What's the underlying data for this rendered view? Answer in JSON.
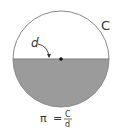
{
  "diagram": {
    "circle": {
      "cx": 61,
      "cy": 59,
      "r": 48,
      "stroke": "#8a8a8a",
      "lower_fill": "#9b9b9b",
      "upper_fill": "#ffffff"
    },
    "center_point": {
      "color": "#111111"
    },
    "labels": {
      "circumference": "C",
      "diameter": "d"
    },
    "formula": {
      "lhs": "π",
      "equals": "=",
      "numerator": "C",
      "denominator": "d"
    }
  }
}
